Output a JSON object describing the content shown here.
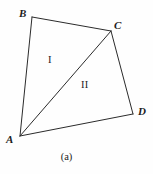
{
  "figure": {
    "caption": "(a)",
    "background_color": "#fefefe",
    "stroke_color": "#2b2b2b",
    "stroke_width": 1,
    "width": 153,
    "height": 174,
    "vertices": [
      {
        "id": "A",
        "label": "A",
        "x": 20,
        "y": 136
      },
      {
        "id": "B",
        "label": "B",
        "x": 32,
        "y": 17
      },
      {
        "id": "C",
        "label": "C",
        "x": 111,
        "y": 31
      },
      {
        "id": "D",
        "label": "D",
        "x": 133,
        "y": 114
      }
    ],
    "edges": [
      {
        "id": "AB",
        "from": "A",
        "to": "B",
        "kind": "side"
      },
      {
        "id": "BC",
        "from": "B",
        "to": "C",
        "kind": "side"
      },
      {
        "id": "CD",
        "from": "C",
        "to": "D",
        "kind": "side"
      },
      {
        "id": "DA",
        "from": "D",
        "to": "A",
        "kind": "side"
      },
      {
        "id": "AC",
        "from": "A",
        "to": "C",
        "kind": "diagonal"
      }
    ],
    "regions": [
      {
        "id": "I",
        "label": "I",
        "x": 51,
        "y": 60,
        "vertices": "A B C"
      },
      {
        "id": "II",
        "label": "II",
        "x": 87,
        "y": 85,
        "vertices": "A C D"
      }
    ]
  }
}
